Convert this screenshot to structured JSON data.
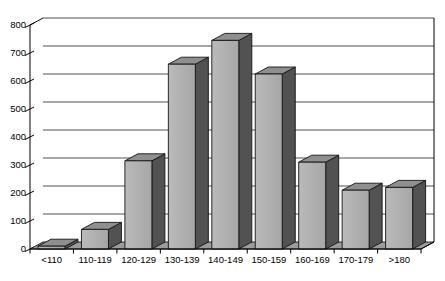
{
  "chart_data": {
    "type": "bar",
    "style": "3d-column",
    "title": "",
    "xlabel": "",
    "ylabel": "",
    "categories": [
      "<110",
      "110-119",
      "120-129",
      "130-139",
      "140-149",
      "150-159",
      "160-169",
      "170-179",
      ">180"
    ],
    "values": [
      10,
      70,
      315,
      660,
      745,
      625,
      310,
      210,
      220
    ],
    "yticks": [
      0,
      100,
      200,
      300,
      400,
      500,
      600,
      700,
      800
    ],
    "ylim": [
      0,
      800
    ],
    "grid": true,
    "legend_position": "none",
    "colors": {
      "background": "#ffffff",
      "bar_front": "#a6a6a6",
      "bar_front_light": "#bababa",
      "bar_top": "#8f8f8f",
      "bar_side": "#525252",
      "floor": "#9c9c9c",
      "outline": "#141414",
      "gridline": "#3c3c3c",
      "axis": "#000000",
      "text": "#000000"
    }
  }
}
